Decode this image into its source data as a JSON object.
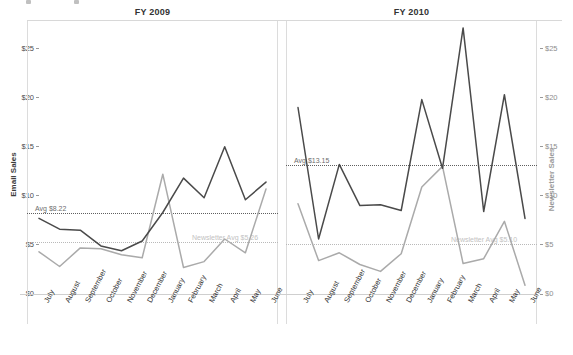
{
  "topbar": {
    "present": true
  },
  "axes": {
    "left_title": "Email Sales",
    "right_title": "Newsletter Sales",
    "yticks": [
      "$0",
      "$5",
      "$10",
      "$15",
      "$20",
      "$25"
    ],
    "ylim": [
      0,
      27.5
    ],
    "months": [
      "July",
      "August",
      "September",
      "October",
      "November",
      "December",
      "January",
      "February",
      "March",
      "April",
      "May",
      "June"
    ]
  },
  "panels": [
    {
      "title": "FY 2009",
      "ref_email_label": "Avg $8.22",
      "ref_email_value": 8.22,
      "ref_news_label": "Newsletter Avg $5.26",
      "ref_news_value": 5.26
    },
    {
      "title": "FY 2010",
      "ref_email_label": "Avg $13.15",
      "ref_email_value": 13.15,
      "ref_news_label": "Newsletter Avg $5.10",
      "ref_news_value": 5.1
    }
  ],
  "colors": {
    "email_line": "#4a4a4a",
    "newsletter_line": "#aaaaaa",
    "reference_line": "#5f5f5f",
    "reference_line_light": "#b9b9b9",
    "grid": "#dcdcdc",
    "text": "#333333"
  },
  "chart_data": [
    {
      "type": "line",
      "title": "FY 2009",
      "xlabel": "",
      "ylabel": "Email Sales",
      "y2label": "Newsletter Sales",
      "ylim": [
        0,
        27.5
      ],
      "grid": false,
      "legend": "none",
      "categories": [
        "July",
        "August",
        "September",
        "October",
        "November",
        "December",
        "January",
        "February",
        "March",
        "April",
        "May",
        "June"
      ],
      "series": [
        {
          "name": "Email Sales",
          "axis": "left",
          "values": [
            7.7,
            6.6,
            6.5,
            4.9,
            4.4,
            5.4,
            8.3,
            11.8,
            9.8,
            15.0,
            9.6,
            11.4
          ]
        },
        {
          "name": "Newsletter Sales",
          "axis": "right",
          "values": [
            4.3,
            2.8,
            4.7,
            4.6,
            4.0,
            3.7,
            12.2,
            2.7,
            3.3,
            5.6,
            4.2,
            10.7
          ]
        }
      ],
      "annotations": [
        {
          "text": "Avg $8.22",
          "type": "reference-line",
          "series": "Email Sales",
          "value": 8.22
        },
        {
          "text": "Newsletter Avg $5.26",
          "type": "reference-line",
          "series": "Newsletter Sales",
          "value": 5.26
        }
      ]
    },
    {
      "type": "line",
      "title": "FY 2010",
      "xlabel": "",
      "ylabel": "Email Sales",
      "y2label": "Newsletter Sales",
      "ylim": [
        0,
        27.5
      ],
      "grid": false,
      "legend": "none",
      "categories": [
        "July",
        "August",
        "September",
        "October",
        "November",
        "December",
        "January",
        "February",
        "March",
        "April",
        "May",
        "June"
      ],
      "series": [
        {
          "name": "Email Sales",
          "axis": "left",
          "values": [
            19.0,
            5.6,
            13.2,
            9.0,
            9.1,
            8.5,
            19.8,
            12.8,
            27.1,
            8.4,
            20.3,
            7.7
          ]
        },
        {
          "name": "Newsletter Sales",
          "axis": "right",
          "values": [
            9.2,
            3.4,
            4.2,
            3.0,
            2.3,
            4.1,
            10.9,
            13.0,
            3.1,
            3.6,
            7.4,
            0.9
          ]
        }
      ],
      "annotations": [
        {
          "text": "Avg $13.15",
          "type": "reference-line",
          "series": "Email Sales",
          "value": 13.15
        },
        {
          "text": "Newsletter Avg $5.10",
          "type": "reference-line",
          "series": "Newsletter Sales",
          "value": 5.1
        }
      ]
    }
  ]
}
